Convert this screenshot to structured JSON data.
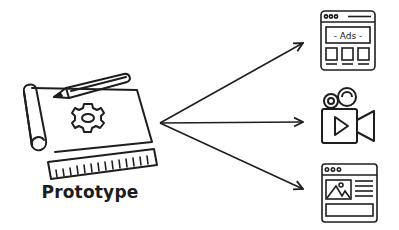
{
  "diagram": {
    "source": {
      "label": "Prototype",
      "icon": "blueprint-gear-pencil-ruler-icon"
    },
    "arrows": [
      {
        "from": "prototype",
        "to": "ads-webpage"
      },
      {
        "from": "prototype",
        "to": "video-camera"
      },
      {
        "from": "prototype",
        "to": "image-webpage"
      }
    ],
    "targets": [
      {
        "name": "ads-webpage",
        "icon": "browser-ads-icon",
        "text": "- Ads -"
      },
      {
        "name": "video-camera",
        "icon": "video-camera-icon"
      },
      {
        "name": "image-webpage",
        "icon": "browser-image-icon"
      }
    ],
    "colors": {
      "stroke": "#1e1e1e",
      "background": "#ffffff"
    }
  }
}
